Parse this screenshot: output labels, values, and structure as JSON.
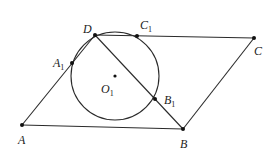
{
  "diagram": {
    "type": "geometry",
    "points": {
      "A": {
        "label": "A",
        "sub": "",
        "x": 22,
        "y": 125,
        "lx": 18,
        "ly": 144
      },
      "B": {
        "label": "B",
        "sub": "",
        "x": 183,
        "y": 129,
        "lx": 180,
        "ly": 148
      },
      "C": {
        "label": "C",
        "sub": "",
        "x": 254,
        "y": 38,
        "lx": 254,
        "ly": 55
      },
      "D": {
        "label": "D",
        "sub": "",
        "x": 95,
        "y": 35,
        "lx": 83,
        "ly": 33
      },
      "A1": {
        "label": "A",
        "sub": "1",
        "x": 72,
        "y": 63,
        "lx": 53,
        "ly": 67
      },
      "B1": {
        "label": "B",
        "sub": "1",
        "x": 155,
        "y": 99,
        "lx": 164,
        "ly": 104
      },
      "C1": {
        "label": "C",
        "sub": "1",
        "x": 137,
        "y": 36,
        "lx": 140,
        "ly": 29
      },
      "O1": {
        "label": "O",
        "sub": "1",
        "x": 115,
        "y": 76,
        "lx": 101,
        "ly": 93
      }
    },
    "circle": {
      "name": "O1",
      "cx": 115,
      "cy": 76,
      "r": 44
    },
    "segments": [
      [
        "A",
        "B"
      ],
      [
        "B",
        "C"
      ],
      [
        "C",
        "D"
      ],
      [
        "D",
        "A"
      ],
      [
        "D",
        "B"
      ]
    ],
    "colors": {
      "stroke": "#2a2a2a",
      "point": "#111111",
      "text": "#222222"
    }
  }
}
